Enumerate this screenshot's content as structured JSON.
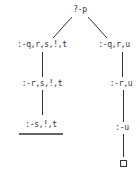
{
  "diagram": {
    "type": "SLD resolution tree",
    "root": "?-p",
    "left_branch": [
      ":-q,r,s,!,t",
      ":-r,s,!,t",
      ":-s,!,t"
    ],
    "right_branch": [
      ":-q,r,u",
      ":-r,u",
      ":-u"
    ],
    "left_terminal": "underlined (cut/failure)",
    "right_terminal": "empty-clause-box",
    "line_color": "#333333"
  }
}
